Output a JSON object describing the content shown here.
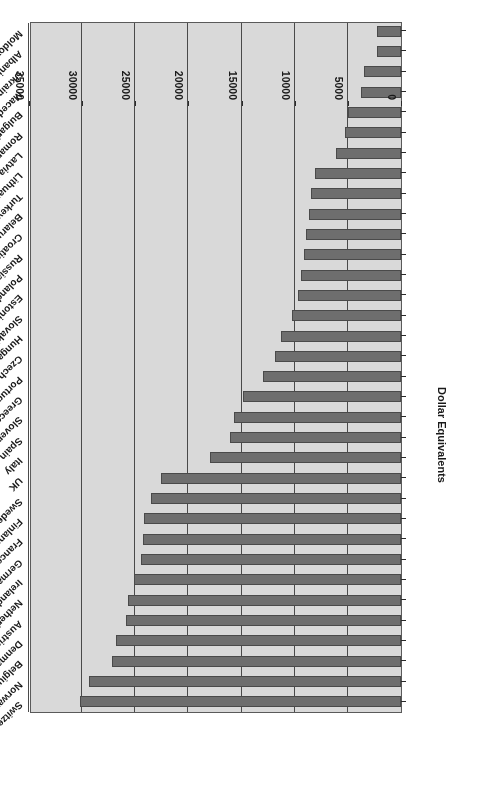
{
  "chart_data": {
    "type": "bar",
    "orientation": "horizontal",
    "title": "",
    "subtitle": "",
    "xlabel": "",
    "ylabel": "Dollar Equivalents",
    "axis_title": "Dollar Equivalents",
    "value_axis_ticks": [
      "0",
      "5000",
      "10000",
      "15000",
      "20000",
      "25000",
      "30000",
      "35000"
    ],
    "value_axis_tick_values": [
      0,
      5000,
      10000,
      15000,
      20000,
      25000,
      30000,
      35000
    ],
    "ylim": [
      0,
      35000
    ],
    "grid": true,
    "legend": null,
    "rotated_180": true,
    "bar_color": "#6e6e6e",
    "plot_background": "#d9d9d9",
    "categories": [
      "Switzerland",
      "Norway",
      "Belgium",
      "Denmark",
      "Austria",
      "Netherlands",
      "Ireland",
      "Germany",
      "France",
      "Finland",
      "Sweden",
      "UK",
      "Italy",
      "Spain",
      "Slovenia",
      "Greece",
      "Portugal",
      "Czech Republic",
      "Hungary",
      "Slovakia",
      "Estonia",
      "Poland",
      "Russia",
      "Croatia",
      "Belarus",
      "Turkey",
      "Lithuania",
      "Latvia",
      "Romania",
      "Bulgaria",
      "Macedonia",
      "Ukraine",
      "Albania",
      "Moldova"
    ],
    "values": [
      30200,
      29400,
      27200,
      26800,
      25900,
      25700,
      25100,
      24500,
      24300,
      24200,
      23500,
      22600,
      18000,
      16100,
      15700,
      14900,
      13000,
      11900,
      11300,
      10300,
      9700,
      9400,
      9100,
      8900,
      8700,
      8500,
      8100,
      6100,
      5300,
      5000,
      3800,
      3500,
      2300,
      2300
    ]
  }
}
